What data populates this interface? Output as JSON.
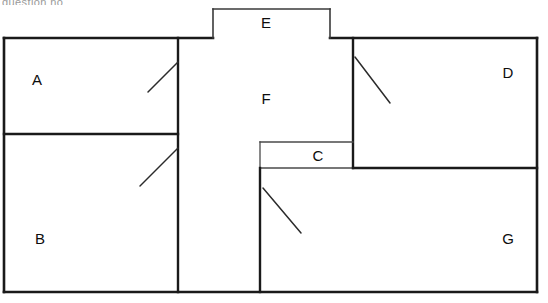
{
  "diagram": {
    "caption_fragment": "question no",
    "canvas": {
      "width": 548,
      "height": 303
    },
    "background_color": "#ffffff",
    "line_color": "#1a1a1a"
  },
  "rooms": [
    {
      "id": "A",
      "label": "A",
      "label_x": 37,
      "label_y": 79,
      "x": 4,
      "y": 38,
      "width": 174,
      "height": 96
    },
    {
      "id": "B",
      "label": "B",
      "label_x": 40,
      "label_y": 238,
      "x": 4,
      "y": 134,
      "width": 174,
      "height": 158
    },
    {
      "id": "C",
      "label": "C",
      "label_x": 318,
      "label_y": 155,
      "x": 260,
      "y": 142,
      "width": 93,
      "height": 26
    },
    {
      "id": "D",
      "label": "D",
      "label_x": 508,
      "label_y": 72,
      "x": 353,
      "y": 38,
      "width": 184,
      "height": 130
    },
    {
      "id": "E",
      "label": "E",
      "label_x": 266,
      "label_y": 22,
      "x": 213,
      "y": 9,
      "width": 117,
      "height": 29
    },
    {
      "id": "F",
      "label": "F",
      "label_x": 266,
      "label_y": 98,
      "x": 178,
      "y": 38,
      "width": 175,
      "height": 130
    },
    {
      "id": "G",
      "label": "G",
      "label_x": 508,
      "label_y": 238,
      "x": 260,
      "y": 168,
      "width": 277,
      "height": 124
    }
  ],
  "walls": [
    {
      "name": "outer-top-left",
      "x1": 4,
      "y1": 38,
      "x2": 213,
      "y2": 38,
      "weight": "outer"
    },
    {
      "name": "outer-top-right",
      "x1": 330,
      "y1": 38,
      "x2": 537,
      "y2": 38,
      "weight": "outer"
    },
    {
      "name": "outer-left",
      "x1": 4,
      "y1": 38,
      "x2": 4,
      "y2": 292,
      "weight": "outer"
    },
    {
      "name": "outer-bottom",
      "x1": 4,
      "y1": 292,
      "x2": 537,
      "y2": 292,
      "weight": "outer"
    },
    {
      "name": "outer-right",
      "x1": 537,
      "y1": 38,
      "x2": 537,
      "y2": 292,
      "weight": "outer"
    },
    {
      "name": "alcove-e-left",
      "x1": 213,
      "y1": 9,
      "x2": 213,
      "y2": 38,
      "weight": "minor"
    },
    {
      "name": "alcove-e-top",
      "x1": 213,
      "y1": 9,
      "x2": 330,
      "y2": 9,
      "weight": "minor"
    },
    {
      "name": "alcove-e-right",
      "x1": 330,
      "y1": 9,
      "x2": 330,
      "y2": 38,
      "weight": "minor"
    },
    {
      "name": "divider-ab-f",
      "x1": 178,
      "y1": 38,
      "x2": 178,
      "y2": 292,
      "weight": "major"
    },
    {
      "name": "divider-a-b",
      "x1": 4,
      "y1": 134,
      "x2": 178,
      "y2": 134,
      "weight": "major"
    },
    {
      "name": "divider-f-d",
      "x1": 353,
      "y1": 38,
      "x2": 353,
      "y2": 168,
      "weight": "major"
    },
    {
      "name": "room-c-top",
      "x1": 260,
      "y1": 142,
      "x2": 353,
      "y2": 142,
      "weight": "thin"
    },
    {
      "name": "room-c-left",
      "x1": 260,
      "y1": 142,
      "x2": 260,
      "y2": 168,
      "weight": "thin"
    },
    {
      "name": "room-c-bottom",
      "x1": 260,
      "y1": 168,
      "x2": 353,
      "y2": 168,
      "weight": "thin"
    },
    {
      "name": "divider-d-g",
      "x1": 353,
      "y1": 168,
      "x2": 537,
      "y2": 168,
      "weight": "major"
    },
    {
      "name": "divider-f-g",
      "x1": 260,
      "y1": 168,
      "x2": 260,
      "y2": 292,
      "weight": "major"
    }
  ],
  "door_swings": [
    {
      "name": "door-room-a",
      "x1": 178,
      "y1": 62,
      "x2": 148,
      "y2": 92
    },
    {
      "name": "door-room-b",
      "x1": 178,
      "y1": 148,
      "x2": 140,
      "y2": 186
    },
    {
      "name": "door-room-d",
      "x1": 355,
      "y1": 57,
      "x2": 390,
      "y2": 103
    },
    {
      "name": "door-room-g",
      "x1": 263,
      "y1": 188,
      "x2": 301,
      "y2": 233
    }
  ]
}
